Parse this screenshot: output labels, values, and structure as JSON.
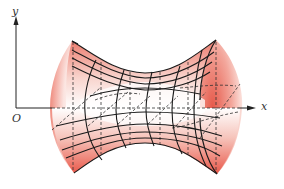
{
  "figure": {
    "axes": {
      "y_label": "y",
      "x_label": "x",
      "origin_label": "O"
    },
    "colors": {
      "surface_fill": "#e8574a",
      "surface_light": "#fbe3df",
      "mesh_line": "#1a1a1a",
      "hidden_line": "#333333",
      "axis": "#222222"
    }
  }
}
